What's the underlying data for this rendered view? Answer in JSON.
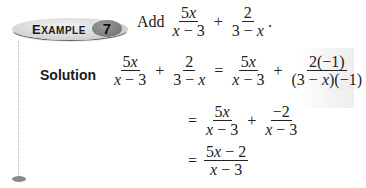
{
  "example": {
    "label_first": "E",
    "label_rest": "XAMPLE",
    "number": "7"
  },
  "problem": {
    "verb": "Add",
    "term1": {
      "num": "5x",
      "den": "x − 3"
    },
    "operator": "+",
    "term2": {
      "num": "2",
      "den": "3 − x"
    },
    "end": "."
  },
  "solution": {
    "label": "Solution",
    "lhs": {
      "term1": {
        "num": "5x",
        "den": "x − 3"
      },
      "operator": "+",
      "term2": {
        "num": "2",
        "den": "3 − x"
      }
    },
    "steps": [
      {
        "eq": "=",
        "term1": {
          "num": "5x",
          "den": "x − 3"
        },
        "operator": "+",
        "term2": {
          "num": "2(−1)",
          "den": "(3 − x)(−1)"
        }
      },
      {
        "eq": "=",
        "term1": {
          "num": "5x",
          "den": "x − 3"
        },
        "operator": "+",
        "term2": {
          "num": "−2",
          "den": "x − 3"
        }
      },
      {
        "eq": "=",
        "term1": {
          "num": "5x − 2",
          "den": "x − 3"
        }
      }
    ]
  },
  "colors": {
    "badge_light": "#d6d6d6",
    "badge_dark": "#7a7a7a",
    "rule": "#b5b5b5",
    "text": "#222222"
  }
}
